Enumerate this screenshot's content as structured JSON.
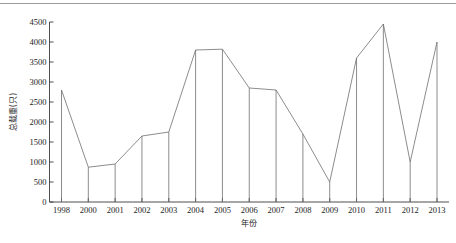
{
  "chart_data": {
    "type": "line",
    "title": "",
    "subtitle": "",
    "xlabel": "年份",
    "ylabel": "总载重(只)",
    "categories": [
      "1998",
      "2000",
      "2001",
      "2002",
      "2003",
      "2004",
      "2005",
      "2006",
      "2007",
      "2008",
      "2009",
      "2010",
      "2011",
      "2012",
      "2013"
    ],
    "values": [
      2800,
      870,
      950,
      1650,
      1750,
      3800,
      3820,
      2850,
      2800,
      1700,
      500,
      3600,
      4450,
      1000,
      4000
    ],
    "series": [
      {
        "name": "总载重(只)",
        "values": [
          2800,
          870,
          950,
          1650,
          1750,
          3800,
          3820,
          2850,
          2800,
          1700,
          500,
          3600,
          4450,
          1000,
          4000
        ]
      }
    ],
    "ylim": [
      0,
      4500
    ],
    "yticks": [
      0,
      500,
      1000,
      1500,
      2000,
      2500,
      3000,
      3500,
      4000,
      4500
    ],
    "ytick_labels": [
      "0",
      "500",
      "1000",
      "1500",
      "2000",
      "2500",
      "3000",
      "3500",
      "4000",
      "4500"
    ],
    "xtick_labels": [
      "1998",
      "2000",
      "2001",
      "2002",
      "2003",
      "2004",
      "2005",
      "2006",
      "2007",
      "2008",
      "2009",
      "2010",
      "2011",
      "2012",
      "2013"
    ],
    "grid": false,
    "legend": false,
    "legend_position": "none",
    "marker_style": "none",
    "drop_lines": true,
    "line_color": "#6e6e6e",
    "axis_color": "#3a3a3a",
    "background_color": "#ffffff",
    "annotations": []
  }
}
